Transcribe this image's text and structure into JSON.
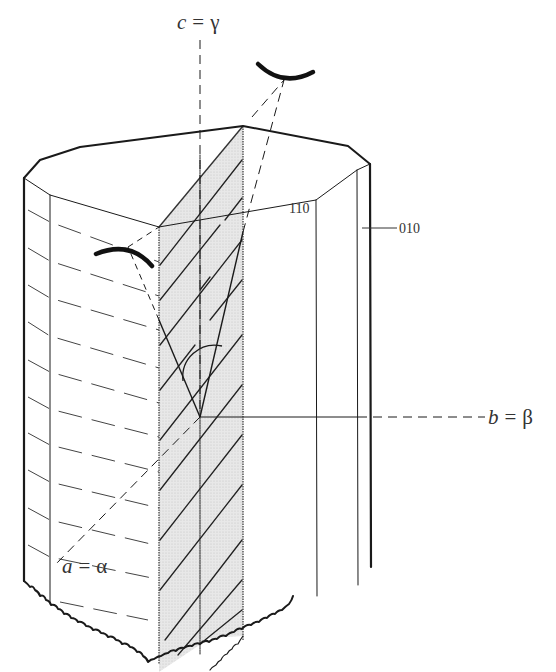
{
  "figure": {
    "type": "crystal-optics-diagram",
    "colors": {
      "background": "#ffffff",
      "line": "#1a1a1a",
      "thin_line": "#444444",
      "plane_fill": "#e6e6e6",
      "label": "#333333"
    },
    "axes": {
      "c": {
        "symbol": "c",
        "eq": "=",
        "greek": "γ"
      },
      "b": {
        "symbol": "b",
        "eq": "=",
        "greek": "β"
      },
      "a": {
        "symbol": "a",
        "eq": "=",
        "greek": "α"
      }
    },
    "faces": {
      "f110": "110",
      "f010": "010"
    }
  }
}
